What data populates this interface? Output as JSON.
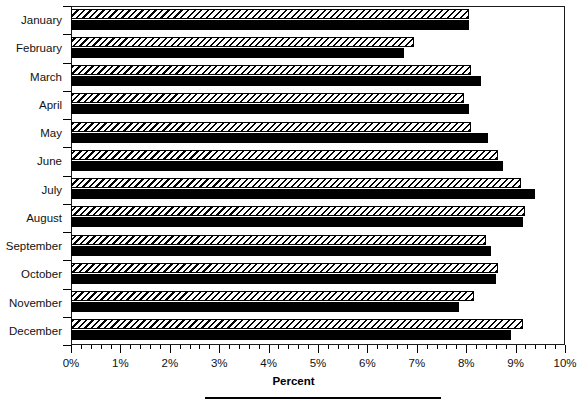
{
  "chart_data": {
    "type": "bar",
    "orientation": "horizontal",
    "title": "",
    "xlabel": "Percent",
    "ylabel": "",
    "xlim": [
      0,
      10
    ],
    "xtick_values": [
      0,
      1,
      2,
      3,
      4,
      5,
      6,
      7,
      8,
      9,
      10
    ],
    "xtick_labels": [
      "0%",
      "1%",
      "2%",
      "3%",
      "4%",
      "5%",
      "6%",
      "7%",
      "8%",
      "9%",
      "10%"
    ],
    "minor_ticks_per_interval": 4,
    "grid": false,
    "legend": "none",
    "categories": [
      "January",
      "February",
      "March",
      "April",
      "May",
      "June",
      "July",
      "August",
      "September",
      "October",
      "November",
      "December"
    ],
    "series": [
      {
        "name": "hatched",
        "fill": "diagonal-hatch",
        "values": [
          8.05,
          6.95,
          8.1,
          7.95,
          8.1,
          8.65,
          9.1,
          9.2,
          8.4,
          8.65,
          8.15,
          9.15
        ]
      },
      {
        "name": "solid",
        "fill": "solid-black",
        "values": [
          8.05,
          6.75,
          8.3,
          8.05,
          8.45,
          8.75,
          9.4,
          9.15,
          8.5,
          8.6,
          7.85,
          8.9
        ]
      }
    ]
  },
  "axis": {
    "xlabel_text": "Percent"
  },
  "colors": {
    "foreground": "#000000",
    "background": "#ffffff",
    "bar_solid": "#000000",
    "bar_hatch_line": "#000000",
    "bar_hatch_background": "#ffffff",
    "frame": "#1a1a1a"
  }
}
